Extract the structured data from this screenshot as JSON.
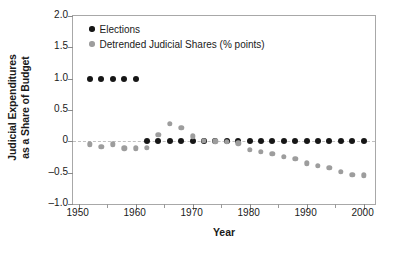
{
  "chart_data": {
    "type": "scatter",
    "title": "",
    "xlabel": "Year",
    "ylabel": "Judicial Expenditures as a Share of Budget",
    "ylabel_lines": [
      "Judicial Expenditures",
      "as a Share of Budget"
    ],
    "xlim": [
      1949,
      2002
    ],
    "ylim": [
      -1.0,
      2.0
    ],
    "xticks": [
      1950,
      1960,
      1970,
      1980,
      1990,
      2000
    ],
    "xtick_labels": [
      "1950",
      "1960",
      "1970",
      "1980",
      "1990",
      "2000"
    ],
    "xticks_minor": [
      1955,
      1965,
      1975,
      1985,
      1995
    ],
    "yticks": [
      2.0,
      1.5,
      1.0,
      0.5,
      0,
      -0.5,
      -1.0
    ],
    "ytick_labels": [
      "2.0",
      "1.5",
      "1.0",
      "0.5",
      "0",
      "–0.5",
      "–1.0"
    ],
    "grid": false,
    "zero_reference_line": true,
    "legend_position": "top-left",
    "colors": {
      "elections": "#161616",
      "shares": "#9d9d9d",
      "zero_line": "#c0c0c0",
      "frame": "#a8a8a8"
    },
    "series": [
      {
        "name": "Elections",
        "marker": "circle",
        "color": "#161616",
        "x": [
          1952,
          1954,
          1956,
          1958,
          1960,
          1962,
          1964,
          1966,
          1968,
          1970,
          1972,
          1974,
          1976,
          1978,
          1980,
          1982,
          1984,
          1986,
          1988,
          1990,
          1992,
          1994,
          1996,
          1998,
          2000
        ],
        "values": [
          1.0,
          1.0,
          1.0,
          1.0,
          1.0,
          0.0,
          0.0,
          0.0,
          0.0,
          0.0,
          0.0,
          0.0,
          0.0,
          0.0,
          0.0,
          0.0,
          0.0,
          0.0,
          0.0,
          0.0,
          0.0,
          0.0,
          0.0,
          0.0,
          0.0
        ]
      },
      {
        "name": "Detrended Judicial Shares (% points)",
        "marker": "circle",
        "color": "#9d9d9d",
        "x": [
          1952,
          1954,
          1956,
          1958,
          1960,
          1962,
          1964,
          1966,
          1968,
          1970,
          1972,
          1974,
          1976,
          1978,
          1980,
          1982,
          1984,
          1986,
          1988,
          1990,
          1992,
          1994,
          1996,
          1998,
          2000
        ],
        "values": [
          -0.05,
          -0.09,
          -0.05,
          -0.11,
          -0.11,
          -0.1,
          0.1,
          0.28,
          0.22,
          0.08,
          0.01,
          0.0,
          -0.01,
          -0.03,
          -0.14,
          -0.17,
          -0.2,
          -0.25,
          -0.28,
          -0.35,
          -0.39,
          -0.42,
          -0.49,
          -0.53,
          -0.54
        ]
      }
    ]
  },
  "legend": {
    "items": [
      {
        "label": "Elections"
      },
      {
        "label": "Detrended Judicial Shares (% points)"
      }
    ]
  }
}
